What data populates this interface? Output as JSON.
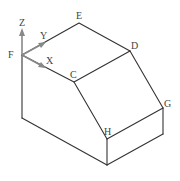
{
  "diagram": {
    "type": "isometric solid with coordinate axes",
    "vertices": {
      "F": {
        "label": "F",
        "x": 22,
        "y": 55
      },
      "E": {
        "label": "E",
        "x": 79,
        "y": 23
      },
      "D": {
        "label": "D",
        "x": 130,
        "y": 51
      },
      "C": {
        "label": "C",
        "x": 74,
        "y": 82
      },
      "G": {
        "label": "G",
        "x": 163,
        "y": 108
      },
      "H": {
        "label": "H",
        "x": 107,
        "y": 139
      }
    },
    "axes": {
      "z": {
        "label": "Z"
      },
      "y": {
        "label": "Y"
      },
      "x": {
        "label": "X"
      }
    },
    "colors": {
      "edge": "#333333",
      "axis": "#888888",
      "label": "#444444"
    }
  }
}
